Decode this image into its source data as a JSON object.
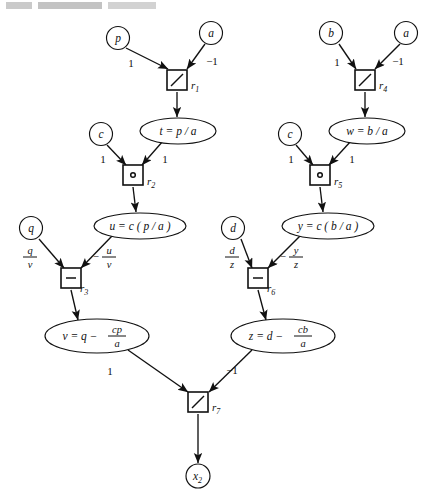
{
  "figure": {
    "kind": "computational-graph",
    "header_artifact": "scanned page header remnant"
  },
  "nodes": {
    "p": {
      "label": "p",
      "shape": "circle",
      "cx": 118,
      "cy": 38
    },
    "a1": {
      "label": "a",
      "shape": "circle",
      "cx": 211,
      "cy": 33
    },
    "b": {
      "label": "b",
      "shape": "circle",
      "cx": 331,
      "cy": 33
    },
    "a2": {
      "label": "a",
      "shape": "circle",
      "cx": 406,
      "cy": 33
    },
    "c1": {
      "label": "c",
      "shape": "circle",
      "cx": 101,
      "cy": 134
    },
    "c2": {
      "label": "c",
      "shape": "circle",
      "cx": 290,
      "cy": 134
    },
    "q": {
      "label": "q",
      "shape": "circle",
      "cx": 31,
      "cy": 228
    },
    "d": {
      "label": "d",
      "shape": "circle",
      "cx": 233,
      "cy": 228
    },
    "x2": {
      "label": "x",
      "sub": "2",
      "shape": "circle",
      "cx": 198,
      "cy": 476
    },
    "t": {
      "label": "t = p / a",
      "shape": "ellipse",
      "cx": 178,
      "cy": 131,
      "rx": 38,
      "ry": 13
    },
    "w": {
      "label": "w = b / a",
      "shape": "ellipse",
      "cx": 367,
      "cy": 131,
      "rx": 38,
      "ry": 13
    },
    "u": {
      "label": "u = c ( p / a )",
      "shape": "ellipse",
      "cx": 140,
      "cy": 226,
      "rx": 46,
      "ry": 13
    },
    "y": {
      "label": "y = c ( b / a )",
      "shape": "ellipse",
      "cx": 328,
      "cy": 226,
      "rx": 46,
      "ry": 13
    },
    "v": {
      "label": "v = q −",
      "frac_num": "cp",
      "frac_den": "a",
      "shape": "ellipse",
      "cx": 97,
      "cy": 336,
      "rx": 52,
      "ry": 17
    },
    "z": {
      "label": "z = d −",
      "frac_num": "cb",
      "frac_den": "a",
      "shape": "ellipse",
      "cx": 283,
      "cy": 336,
      "rx": 52,
      "ry": 17
    }
  },
  "operators": [
    {
      "id": "r1",
      "glyph": "divide",
      "label": "r",
      "sub": "1",
      "cx": 177,
      "cy": 80
    },
    {
      "id": "r4",
      "glyph": "divide",
      "label": "r",
      "sub": "4",
      "cx": 365,
      "cy": 80
    },
    {
      "id": "r2",
      "glyph": "multiply",
      "label": "r",
      "sub": "2",
      "cx": 133,
      "cy": 175
    },
    {
      "id": "r5",
      "glyph": "multiply",
      "label": "r",
      "sub": "5",
      "cx": 320,
      "cy": 175
    },
    {
      "id": "r3",
      "glyph": "subtract",
      "label": "r",
      "sub": "3",
      "cx": 71,
      "cy": 278
    },
    {
      "id": "r6",
      "glyph": "subtract",
      "label": "r",
      "sub": "6",
      "cx": 258,
      "cy": 278
    },
    {
      "id": "r7",
      "glyph": "divide",
      "label": "r",
      "sub": "7",
      "cx": 198,
      "cy": 402
    }
  ],
  "edge_labels": {
    "p_to_r1": "1",
    "a1_to_r1": "−1",
    "b_to_r4": "1",
    "a2_to_r4": "−1",
    "c1_to_r2": "1",
    "t_to_r2": "1",
    "c2_to_r5": "1",
    "w_to_r5": "1",
    "q_to_r3_num": "q",
    "q_to_r3_den": "v",
    "u_to_r3_num": "u",
    "u_to_r3_den": "v",
    "u_to_r3_sign": "−",
    "d_to_r6_num": "d",
    "d_to_r6_den": "z",
    "y_to_r6_num": "y",
    "y_to_r6_den": "z",
    "y_to_r6_sign": "−",
    "v_to_r7": "1",
    "z_to_r7": "−1"
  },
  "colors": {
    "ink": "#111111",
    "paper": "#ffffff"
  }
}
